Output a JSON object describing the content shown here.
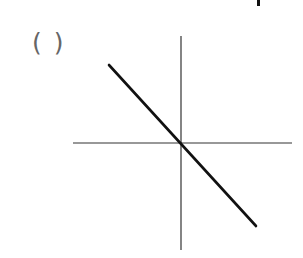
{
  "diagram": {
    "answer_blank": "( )",
    "axes": {
      "origin": [
        181,
        143
      ],
      "x_axis": {
        "from": [
          73,
          143
        ],
        "to": [
          292,
          143
        ],
        "color": "#333333"
      },
      "y_axis": {
        "from": [
          181,
          36
        ],
        "to": [
          181,
          250
        ],
        "color": "#333333"
      }
    },
    "line": {
      "from": [
        109,
        65
      ],
      "to": [
        256,
        226
      ],
      "color": "#111111",
      "description": "straight line through origin with negative slope"
    }
  }
}
